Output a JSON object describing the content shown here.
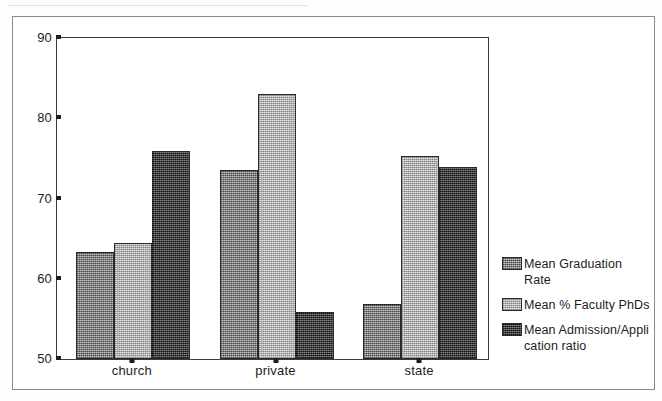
{
  "chart_data": {
    "type": "bar",
    "title": "",
    "subtitle": "",
    "xlabel": "",
    "ylabel": "",
    "categories": [
      "church",
      "private",
      "state"
    ],
    "series": [
      {
        "name": "Mean Graduation Rate",
        "values": [
          63.3,
          73.5,
          56.9
        ],
        "color": "#8d8d8d",
        "pattern": "medium-gray-dither"
      },
      {
        "name": "Mean % Faculty PhDs",
        "values": [
          64.5,
          83.0,
          75.3
        ],
        "color": "#c3c3c3",
        "pattern": "light-gray-dither"
      },
      {
        "name": "Mean Admission/Appli\ncation ratio",
        "values": [
          75.9,
          55.9,
          73.9
        ],
        "color": "#3f3f3f",
        "pattern": "dark-gray-dither"
      }
    ],
    "ylim": [
      50,
      90
    ],
    "yticks": [
      90,
      80,
      70,
      60,
      50
    ],
    "ytick_labels": [
      "90",
      "80",
      "70",
      "60",
      "50"
    ],
    "grid": false,
    "legend_position": "right"
  },
  "legend": {
    "entries": [
      {
        "label": "Mean Graduation Rate"
      },
      {
        "label": "Mean % Faculty PhDs"
      },
      {
        "label": "Mean Admission/Appli\ncation ratio"
      }
    ]
  }
}
